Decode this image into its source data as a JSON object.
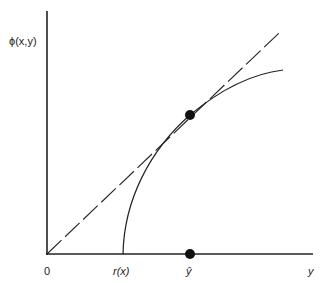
{
  "diagram": {
    "type": "function-graph",
    "y_axis_label": "ϕ(x,y)",
    "x_axis_label": "y",
    "origin_label": "0",
    "x_ticks": [
      {
        "label": "r(x)",
        "description": "curve intercept on horizontal axis"
      },
      {
        "label": "ŷ",
        "description": "tangency point projection"
      }
    ],
    "elements": [
      {
        "name": "dashed-ray",
        "description": "dashed line from origin, tangent to curve"
      },
      {
        "name": "concave-curve",
        "description": "concave increasing curve starting at r(x)"
      },
      {
        "name": "tangency-point",
        "description": "black dot where ray touches curve"
      },
      {
        "name": "axis-point",
        "description": "black dot on horizontal axis at ŷ"
      }
    ],
    "colors": {
      "line": "#222222",
      "background": "#ffffff"
    }
  }
}
